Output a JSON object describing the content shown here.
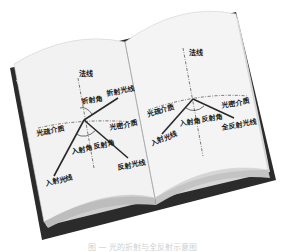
{
  "figure": {
    "caption": "图 — 光的折射与全反射示意图",
    "colors": {
      "cover": "#2b2b2b",
      "page": "#f2f2f2",
      "page_edge": "#c8c8c8",
      "ink": "#1a1a1a"
    }
  },
  "left_page": {
    "title": "refraction-and-reflection",
    "labels": {
      "normal": "法线",
      "refracted_ray": "折射光线",
      "refraction_angle": "折射角",
      "rarer_medium": "光疏介质",
      "denser_medium": "光密介质",
      "incidence_angle": "入射角",
      "reflection_angle": "反射角",
      "reflected_ray": "反射光线",
      "incident_ray": "入射光线"
    }
  },
  "right_page": {
    "title": "total-internal-reflection",
    "labels": {
      "normal": "法线",
      "rarer_medium": "光疏介质",
      "denser_medium": "光密介质",
      "incidence_angle": "入射角",
      "reflection_angle": "反射角",
      "total_reflected_ray": "全反射光线",
      "incident_ray": "入射光线"
    }
  }
}
